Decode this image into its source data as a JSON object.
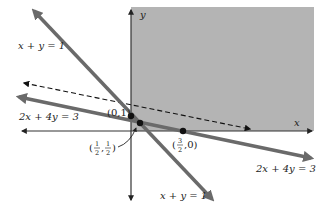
{
  "diagram": {
    "colors": {
      "background": "#ffffff",
      "shaded_region": "#b4b4b4",
      "thick_lines": "#6a6a6a",
      "axes": "#333333",
      "dashed_line": "#111111",
      "points": "#111111"
    },
    "axes": {
      "x_label": "x",
      "y_label": "y"
    },
    "lines": [
      {
        "id": "line-x-plus-y",
        "equation": "x + y = 1",
        "labels": [
          "x + y = 1",
          "x + y = 1"
        ],
        "style": "solid-thick"
      },
      {
        "id": "line-2x-plus-4y",
        "equation": "2x + 4y = 3",
        "labels": [
          "2x + 4y = 3",
          "2x + 4y = 3"
        ],
        "style": "solid-thick"
      },
      {
        "id": "objective-line",
        "equation": "",
        "style": "dashed"
      }
    ],
    "labels": {
      "xy_top": "x + y = 1",
      "xy_bottom": "x + y = 1",
      "c2_left": "2x + 4y = 3",
      "c2_right": "2x + 4y = 3"
    },
    "points": [
      {
        "label": "(0, 1)",
        "x": 0,
        "y": 1
      },
      {
        "label": "(1/2, 1/2)",
        "x": 0.5,
        "y": 0.5,
        "num_x": "1",
        "den_x": "2",
        "num_y": "1",
        "den_y": "2"
      },
      {
        "label": "(3/2, 0)",
        "x": 1.5,
        "y": 0,
        "num_x": "3",
        "den_x": "2",
        "y_val": "0"
      }
    ],
    "point_text": {
      "p0": "(0,1)",
      "p1_open": "(",
      "p1_comma": ",",
      "p1_close": ")",
      "p1_nx": "1",
      "p1_dx": "2",
      "p1_ny": "1",
      "p1_dy": "2",
      "p2_open": "(",
      "p2_nx": "3",
      "p2_dx": "2",
      "p2_rest": ",0)"
    }
  }
}
